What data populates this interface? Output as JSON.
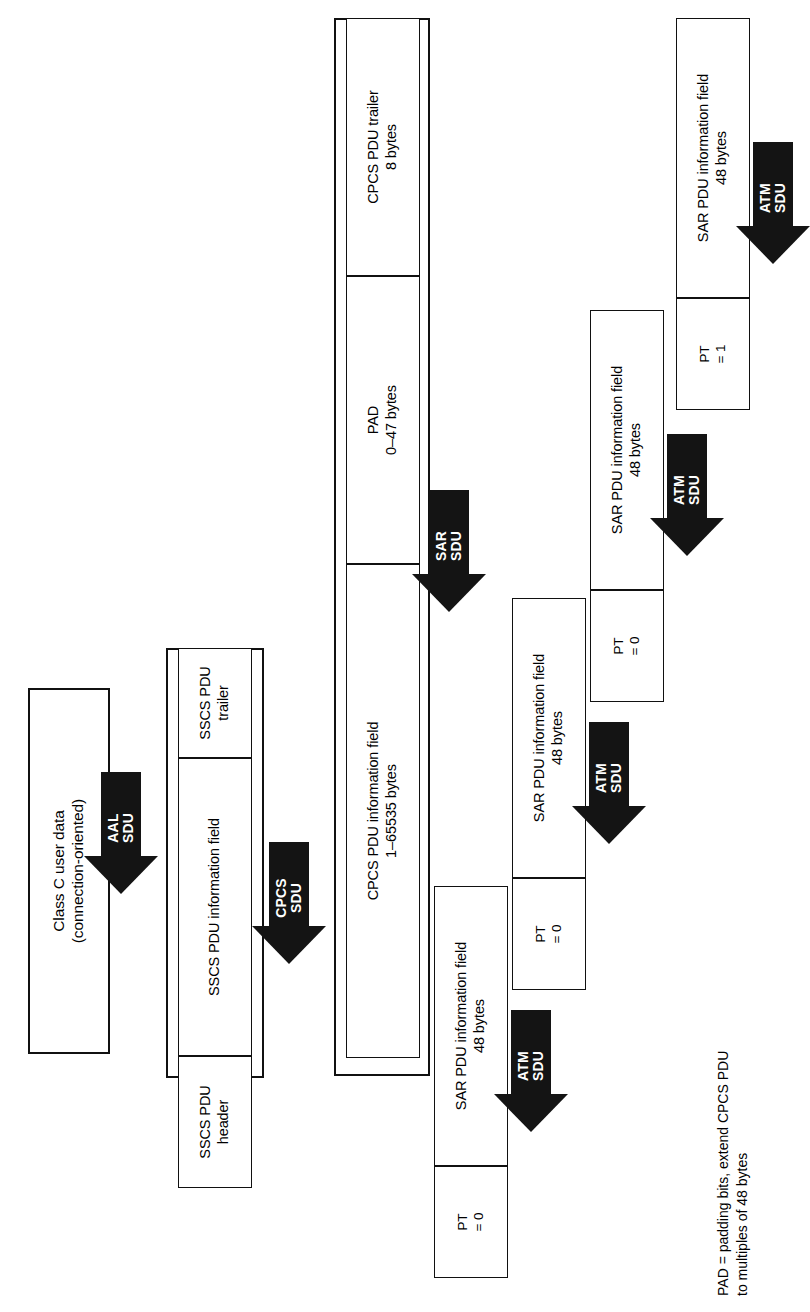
{
  "diagram": {
    "orientation": "rotated-90-ccw",
    "stages": [
      {
        "id": "user-data",
        "label": "Class C user data\n(connection-oriented)",
        "line1": "Class C user data",
        "line2": "(connection-oriented)"
      },
      {
        "id": "sscs-pdu",
        "fields": [
          {
            "id": "sscs-header",
            "line1": "SSCS PDU",
            "line2": "header"
          },
          {
            "id": "sscs-info",
            "line1": "SSCS PDU information field",
            "line2": ""
          },
          {
            "id": "sscs-trailer",
            "line1": "SSCS PDU",
            "line2": "trailer"
          }
        ]
      },
      {
        "id": "cpcs-pdu",
        "fields": [
          {
            "id": "cpcs-info",
            "line1": "CPCS PDU information field",
            "line2": "1–65535 bytes"
          },
          {
            "id": "cpcs-pad",
            "line1": "PAD",
            "line2": "0–47 bytes"
          },
          {
            "id": "cpcs-trailer",
            "line1": "CPCS PDU trailer",
            "line2": "8 bytes"
          }
        ]
      },
      {
        "id": "sar-pdus",
        "cells": [
          {
            "id": "sar-1",
            "line1": "SAR PDU information field",
            "line2": "48 bytes",
            "pt_line1": "PT",
            "pt_line2": "= 0"
          },
          {
            "id": "sar-2",
            "line1": "SAR PDU information field",
            "line2": "48 bytes",
            "pt_line1": "PT",
            "pt_line2": "= 0"
          },
          {
            "id": "sar-3",
            "line1": "SAR PDU information field",
            "line2": "48 bytes",
            "pt_line1": "PT",
            "pt_line2": "= 0"
          },
          {
            "id": "sar-4",
            "line1": "SAR PDU information field",
            "line2": "48 bytes",
            "pt_line1": "PT",
            "pt_line2": "= 1"
          }
        ]
      }
    ],
    "arrows": [
      {
        "id": "aal-sdu",
        "line1": "AAL",
        "line2": "SDU"
      },
      {
        "id": "cpcs-sdu",
        "line1": "CPCS",
        "line2": "SDU"
      },
      {
        "id": "sar-sdu",
        "line1": "SAR",
        "line2": "SDU"
      },
      {
        "id": "atm-sdu-1",
        "line1": "ATM",
        "line2": "SDU"
      },
      {
        "id": "atm-sdu-2",
        "line1": "ATM",
        "line2": "SDU"
      },
      {
        "id": "atm-sdu-3",
        "line1": "ATM",
        "line2": "SDU"
      },
      {
        "id": "atm-sdu-4",
        "line1": "ATM",
        "line2": "SDU"
      }
    ],
    "footnote": {
      "line1": "PAD = padding bits, extend CPCS PDU",
      "line2": "to multiples of 48 bytes"
    },
    "colors": {
      "stroke": "#111111",
      "arrow_fill": "#141414",
      "background": "#ffffff",
      "arrow_text": "#ffffff"
    }
  }
}
